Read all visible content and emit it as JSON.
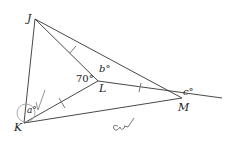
{
  "diagram": {
    "points": {
      "J": {
        "label": "J",
        "x": 35,
        "y": 19
      },
      "K": {
        "label": "K",
        "x": 24,
        "y": 123
      },
      "L": {
        "label": "L",
        "x": 98,
        "y": 81
      },
      "M": {
        "label": "M",
        "x": 182,
        "y": 98
      }
    },
    "angles": {
      "a": "a°",
      "b": "b°",
      "c": "c°",
      "given": "70°"
    },
    "handwriting": "a✓"
  }
}
